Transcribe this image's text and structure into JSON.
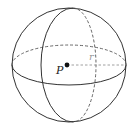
{
  "diagram": {
    "type": "sphere",
    "labels": {
      "center": "P",
      "radius": "r"
    },
    "colors": {
      "stroke": "#333333",
      "dashed": "#555555",
      "radius_label": "#999999",
      "background": "#ffffff"
    }
  }
}
